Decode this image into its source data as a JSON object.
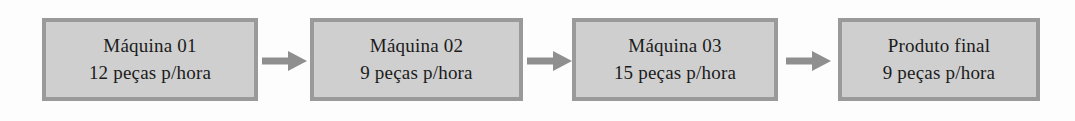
{
  "diagram": {
    "type": "process-flow",
    "orientation": "left-to-right",
    "background_color": "#fdfdfd",
    "node_fill_color": "#cfcfcf",
    "node_border_color": "#9a9a9a",
    "arrow_color": "#8f8f8f",
    "text_color": "#1b1b1b",
    "nodes": [
      {
        "id": "maquina-01",
        "line1": "Máquina 01",
        "line2": "12 peças p/hora"
      },
      {
        "id": "maquina-02",
        "line1": "Máquina 02",
        "line2": "9 peças p/hora"
      },
      {
        "id": "maquina-03",
        "line1": "Máquina 03",
        "line2": "15 peças p/hora"
      },
      {
        "id": "produto-final",
        "line1": "Produto final",
        "line2": "9 peças p/hora"
      }
    ],
    "connectors": [
      {
        "id": "arrow-1",
        "icon": "arrow-right-icon",
        "from": "maquina-01",
        "to": "maquina-02"
      },
      {
        "id": "arrow-2",
        "icon": "arrow-right-icon",
        "from": "maquina-02",
        "to": "maquina-03"
      },
      {
        "id": "arrow-3",
        "icon": "arrow-right-icon",
        "from": "maquina-03",
        "to": "produto-final"
      }
    ]
  }
}
